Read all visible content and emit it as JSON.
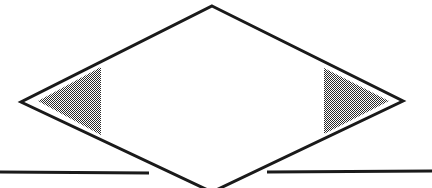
{
  "figure": {
    "canvas": {
      "width": 432,
      "height": 188,
      "background": "#ffffff"
    },
    "colors": {
      "stroke": "#1a1a1a",
      "fill": "#ffffff",
      "shade": "#8c8c8c",
      "shade_pattern": "50-percent-checkerboard-dither"
    },
    "shapes": {
      "diamond": {
        "name": "diamond",
        "points": "212,6 403,101 212,192 21,102",
        "stroke_width": 3,
        "fill": "#ffffff",
        "note": "bottom vertex clipped by canvas edge"
      },
      "left_triangle": {
        "name": "left-shaded-triangle",
        "points": "101,67 101,135 38,101",
        "orientation": "points-left",
        "fill": "#8c8c8c"
      },
      "right_triangle": {
        "name": "right-shaded-triangle",
        "points": "324,68 324,134 389,101",
        "orientation": "points-right",
        "fill": "#8c8c8c"
      },
      "line_left": {
        "name": "horizontal-line-left-segment",
        "x1": 0,
        "y1": 172,
        "x2": 149,
        "y2": 173,
        "stroke_width": 3
      },
      "line_right": {
        "name": "horizontal-line-right-segment",
        "x1": 267,
        "y1": 172,
        "x2": 432,
        "y2": 171,
        "stroke_width": 3
      }
    }
  }
}
